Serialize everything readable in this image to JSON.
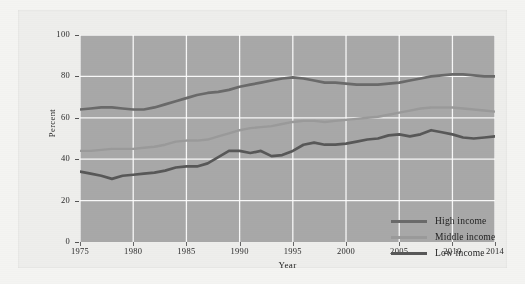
{
  "chart_data": {
    "type": "line",
    "title": "",
    "xlabel": "Year",
    "ylabel": "Percent",
    "xlim": [
      1975,
      2014
    ],
    "ylim": [
      0,
      100
    ],
    "grid": true,
    "legend_position": "inside-bottom-right",
    "x_ticks": [
      "1975",
      "1980",
      "1985",
      "1990",
      "1995",
      "2000",
      "2005",
      "2010",
      "2014"
    ],
    "x_tick_values": [
      1975,
      1980,
      1985,
      1990,
      1995,
      2000,
      2005,
      2010,
      2014
    ],
    "y_ticks": [
      "0",
      "20",
      "40",
      "60",
      "80",
      "100"
    ],
    "y_tick_values": [
      0,
      20,
      40,
      60,
      80,
      100
    ],
    "x": [
      1975,
      1976,
      1977,
      1978,
      1979,
      1980,
      1981,
      1982,
      1983,
      1984,
      1985,
      1986,
      1987,
      1988,
      1989,
      1990,
      1991,
      1992,
      1993,
      1994,
      1995,
      1996,
      1997,
      1998,
      1999,
      2000,
      2001,
      2002,
      2003,
      2004,
      2005,
      2006,
      2007,
      2008,
      2009,
      2010,
      2011,
      2012,
      2013,
      2014
    ],
    "series": [
      {
        "name": "High income",
        "color": "#6a6a6a",
        "values": [
          64,
          64.5,
          65,
          65,
          64.5,
          64,
          64,
          65,
          66.5,
          68,
          69.5,
          71,
          72,
          72.5,
          73.5,
          75,
          76,
          77,
          78,
          79,
          79.5,
          79,
          78,
          77,
          77,
          76.5,
          76,
          76,
          76,
          76.5,
          77,
          78,
          79,
          80,
          80.5,
          81,
          81,
          80.5,
          80,
          80
        ]
      },
      {
        "name": "Middle income",
        "color": "#9a9a9a",
        "values": [
          44,
          44,
          44.5,
          45,
          45,
          45,
          45.5,
          46,
          47,
          48.5,
          49,
          49,
          49.5,
          51,
          52.5,
          54,
          55,
          55.5,
          56,
          57,
          58,
          58.5,
          58.5,
          58,
          58.5,
          59,
          59.5,
          60,
          60.5,
          61.5,
          62.5,
          63.5,
          64.5,
          65,
          65,
          65,
          64.5,
          64,
          63.5,
          63
        ]
      },
      {
        "name": "Low income",
        "color": "#585858",
        "values": [
          34,
          33,
          32,
          30.5,
          32,
          32.5,
          33,
          33.5,
          34.5,
          36,
          36.5,
          36.5,
          38,
          41,
          44,
          44,
          43,
          44,
          41.5,
          42,
          44,
          47,
          48,
          47,
          47,
          47.5,
          48.5,
          49.5,
          50,
          51.5,
          52,
          51,
          52,
          54,
          53,
          52,
          50.5,
          50,
          50.5,
          51
        ]
      }
    ]
  },
  "legend": {
    "items": [
      {
        "label": "High income"
      },
      {
        "label": "Middle income"
      },
      {
        "label": "Low income"
      }
    ]
  },
  "axes": {
    "y_title": "Percent",
    "x_title": "Year"
  }
}
